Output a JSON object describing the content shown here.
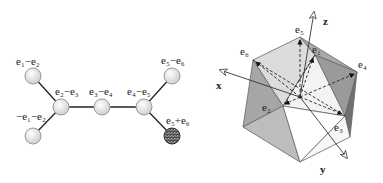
{
  "dynkin": {
    "nodes": [
      {
        "id": "n1",
        "label": "e1−e2",
        "x": 33,
        "y": 76,
        "dark": false
      },
      {
        "id": "n2",
        "label": "e2−e3",
        "x": 61,
        "y": 107,
        "dark": false
      },
      {
        "id": "n3",
        "label": "e3−e4",
        "x": 102,
        "y": 107,
        "dark": false
      },
      {
        "id": "n4",
        "label": "e4−e5",
        "x": 144,
        "y": 107,
        "dark": false
      },
      {
        "id": "n5",
        "label": "e5−e6",
        "x": 172,
        "y": 76,
        "dark": false
      },
      {
        "id": "n6",
        "label": "−e1−e2",
        "x": 33,
        "y": 136,
        "dark": false
      },
      {
        "id": "n7",
        "label": "e5+e6",
        "x": 172,
        "y": 136,
        "dark": true
      }
    ],
    "edges": [
      [
        "n1",
        "n2"
      ],
      [
        "n6",
        "n2"
      ],
      [
        "n2",
        "n3"
      ],
      [
        "n3",
        "n4"
      ],
      [
        "n4",
        "n5"
      ],
      [
        "n4",
        "n7"
      ]
    ],
    "labels": {
      "n1": "e₁−e₂",
      "n2": "e₂−e₃",
      "n3": "e₃−e₄",
      "n4": "e₄−e₅",
      "n5": "e₅−e₆",
      "n6": "−e₁−e₂",
      "n7": "e₅+e₆"
    },
    "colors": {
      "node_fill": "#e8e8e8",
      "node_stroke": "#9a9a9a",
      "dark_node": "#555555",
      "edge": "#222222"
    }
  },
  "polytope": {
    "vertex_labels": {
      "e5": "e₅",
      "e6": "e₆",
      "e1": "e₁",
      "e4": "e₄",
      "e2": "e₂",
      "e3": "e₃"
    },
    "axes": {
      "x": "x",
      "y": "y",
      "z": "z"
    },
    "colors": {
      "light_face": "#dcdcdc",
      "mid_face": "#bdbdbd",
      "dark_face": "#8f8f8f",
      "white_face": "#ffffff",
      "edge": "#555555"
    }
  }
}
